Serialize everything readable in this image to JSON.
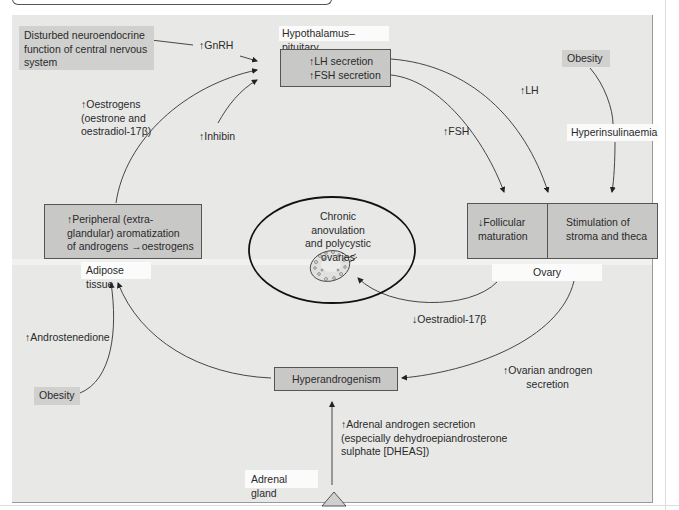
{
  "diagram": {
    "nodes": {
      "disturbed_cns": "Disturbed neuroendocrine\nfunction of central nervous\nsystem",
      "hypothalamus_label": "Hypothalamus–pituitary",
      "lh_fsh_box": "↑LH secretion\n↑FSH secretion",
      "obesity_top": "Obesity",
      "hyperinsulinaemia": "Hyperinsulinaemia",
      "follicular": "↓Follicular\nmaturation",
      "stroma": "Stimulation of\nstroma and theca",
      "ovary_label": "Ovary",
      "center_title": "Chronic anovulation\nand polycystic ovaries",
      "peripheral_box": "↑Peripheral (extra-\nglandular) aromatization\nof androgens →oestrogens",
      "adipose_label": "Adipose tissue",
      "obesity_bottom": "Obesity",
      "hyperandrogenism": "Hyperandrogenism",
      "adrenal_label": "Adrenal gland"
    },
    "edge_labels": {
      "gnrh": "↑GnRH",
      "oestrogens": "↑Oestrogens\n(oestrone and\noestradiol-17β)",
      "inhibin": "↑Inhibin",
      "lh": "↑LH",
      "fsh": "↑FSH",
      "oestradiol_down": "↓Oestradiol-17β",
      "androstenedione": "↑Androstenedione",
      "ovarian_androgen": "↑Ovarian androgen\nsecretion",
      "adrenal_androgen": "↑Adrenal androgen secretion\n(especially dehydroepiandrosterone\nsulphate [DHEAS])"
    },
    "colors": {
      "panel_bg": "#e8e8e7",
      "box_fill": "#c8c8c7",
      "tag_fill": "#d0d0cf",
      "label_fill": "#fbfbfb",
      "line": "#333333"
    }
  }
}
